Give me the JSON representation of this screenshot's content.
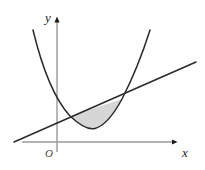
{
  "figure": {
    "background_color": "#ffffff",
    "width": 205,
    "height": 170
  },
  "axes": {
    "x_axis": {
      "label": "x",
      "color": "#9a9a9a",
      "arrow_color": "#1a1a1a",
      "y_pixel": 142,
      "x_start": 22,
      "x_end": 178,
      "label_x": 184,
      "label_y": 155
    },
    "y_axis": {
      "label": "y",
      "color": "#9a9a9a",
      "arrow_color": "#1a1a1a",
      "x_pixel": 57,
      "y_start": 152,
      "y_end": 16,
      "label_x": 45,
      "label_y": 18
    },
    "origin": {
      "label": "O",
      "x": 46,
      "y": 156
    }
  },
  "curves": {
    "parabola": {
      "name": "parabola",
      "color": "#2a2a2a",
      "stroke_width": 1.5,
      "vertex": [
        95,
        128
      ],
      "y_intercept": [
        57,
        95
      ],
      "left_arm_end": [
        33,
        30
      ],
      "right_arm_end": [
        150,
        30
      ],
      "path": "M 33 30 Q 48 92 70 116 Q 86 131 95 128.5 Q 108 125 122 99 Q 138 68 150 30"
    },
    "line": {
      "name": "line",
      "color": "#2a2a2a",
      "stroke_width": 1.5,
      "start": [
        14,
        142
      ],
      "end": [
        196,
        62
      ],
      "path": "M 14 142 L 196 62"
    }
  },
  "shaded_region": {
    "name": "bounded-region",
    "fill_color": "#d6d6d6",
    "stroke_color": "#2a2a2a",
    "stroke_width": 1.2,
    "left_intersection": [
      70,
      116
    ],
    "right_intersection": [
      122,
      99
    ],
    "path": "M 70 116 L 122 99 Q 108 125 95 128.5 Q 86 131 70 116 Z"
  }
}
